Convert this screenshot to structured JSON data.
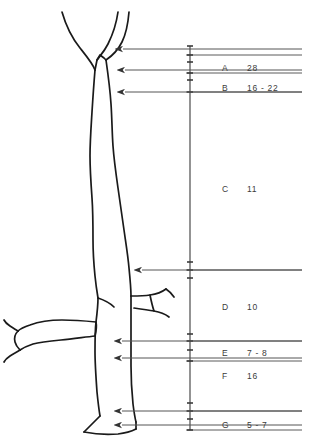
{
  "figure": {
    "name": "anatomical-measurement-diagram",
    "background_color": "#ffffff",
    "line_color": "#1a1a1a",
    "leader_color": "#555555",
    "text_color": "#3b3b3b"
  },
  "measurement_table": {
    "rows": [
      {
        "label": "A",
        "value": "28",
        "label_x": 222,
        "value_x": 247,
        "text_y": 64,
        "arrow_y": 49,
        "rule_top_y": 55,
        "rule_bottom_y": 73
      },
      {
        "label": "B",
        "value": "16 - 22",
        "label_x": 222,
        "value_x": 247,
        "text_y": 84,
        "arrow_y": 70,
        "rule_top_y": 73,
        "rule_bottom_y": 92
      },
      {
        "label": "C",
        "value": "11",
        "label_x": 222,
        "value_x": 247,
        "text_y": 185,
        "arrow_y": 92,
        "rule_top_y": 92,
        "rule_bottom_y": 270
      },
      {
        "label": "D",
        "value": "10",
        "label_x": 222,
        "value_x": 247,
        "text_y": 303,
        "arrow_y": 270,
        "rule_top_y": 270,
        "rule_bottom_y": 341
      },
      {
        "label": "E",
        "value": "7 - 8",
        "label_x": 222,
        "value_x": 247,
        "text_y": 349,
        "arrow_y": 341,
        "rule_top_y": 341,
        "rule_bottom_y": 361
      },
      {
        "label": "F",
        "value": "16",
        "label_x": 222,
        "value_x": 247,
        "text_y": 372,
        "arrow_y": 358,
        "rule_top_y": 361,
        "rule_bottom_y": 411
      },
      {
        "label": "G",
        "value": "5 - 7",
        "label_x": 222,
        "value_x": 247,
        "text_y": 421,
        "arrow_y": 411,
        "rule_top_y": 411,
        "rule_bottom_y": 430
      }
    ],
    "rule_x_start": 186,
    "rule_x_end": 302,
    "dimension_line_x": 190,
    "dimension_line_top": 46,
    "dimension_line_bottom": 430
  },
  "leader_arrows": [
    {
      "name": "arrow-a",
      "y": 49,
      "tip_x": 123,
      "tail_x": 302
    },
    {
      "name": "arrow-b",
      "y": 70,
      "tip_x": 125,
      "tail_x": 302
    },
    {
      "name": "arrow-c",
      "y": 92,
      "tip_x": 125,
      "tail_x": 302
    },
    {
      "name": "arrow-d",
      "y": 270,
      "tip_x": 142,
      "tail_x": 302
    },
    {
      "name": "arrow-e",
      "y": 341,
      "tip_x": 122,
      "tail_x": 302
    },
    {
      "name": "arrow-f",
      "y": 358,
      "tip_x": 122,
      "tail_x": 302
    },
    {
      "name": "arrow-g",
      "y": 411,
      "tip_x": 122,
      "tail_x": 302
    },
    {
      "name": "arrow-h",
      "y": 425,
      "tip_x": 122,
      "tail_x": 302
    }
  ],
  "tick_marks_y": [
    46,
    55,
    62,
    73,
    80,
    92,
    262,
    270,
    278,
    334,
    341,
    350,
    361,
    403,
    411,
    419,
    430
  ]
}
